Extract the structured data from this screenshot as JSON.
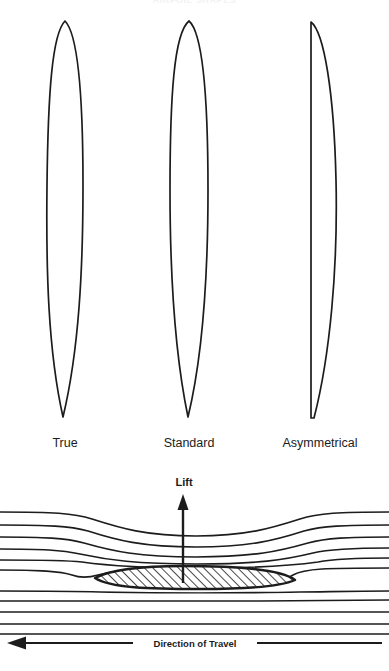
{
  "figure": {
    "top_caption": "AIRFOIL SHAPES",
    "background_color": "#ffffff",
    "line_color": "#1c1c1c"
  },
  "airfoil_profiles": {
    "section_label": "Airfoil profile comparison",
    "items": [
      {
        "label": "True",
        "description": "symmetrical lens profile, rounded leading edge, pointed trailing edge",
        "center_x": 65,
        "max_width": 34,
        "top_y": 20,
        "bottom_y": 420
      },
      {
        "label": "Standard",
        "description": "symmetrical profile, slightly fuller mid-section",
        "center_x": 189,
        "max_width": 36,
        "top_y": 20,
        "bottom_y": 420
      },
      {
        "label": "Asymmetrical",
        "description": "flat left face with single-sided curvature on the right",
        "center_x": 320,
        "max_width": 34,
        "top_y": 20,
        "bottom_y": 420
      }
    ]
  },
  "airflow_diagram": {
    "lift_label": "Lift",
    "direction_label": "Direction of Travel",
    "lift_arrow": {
      "x": 183,
      "tip_y": 496,
      "tail_y": 580,
      "direction": "up"
    },
    "travel_arrow": {
      "y": 643,
      "tip_x": 8,
      "tail_x": 381,
      "direction": "left"
    },
    "airfoil_section": {
      "fill_pattern": "diagonal-hatch",
      "leading_edge_x": 295,
      "trailing_edge_x": 95,
      "top_y": 566,
      "bottom_y": 589
    },
    "streamlines": {
      "count": 11,
      "deflected_above_count": 6,
      "straight_below_count": 5,
      "note": "upper streamlines deflect up and compress over the airfoil; lower streamlines remain nearly straight"
    }
  }
}
